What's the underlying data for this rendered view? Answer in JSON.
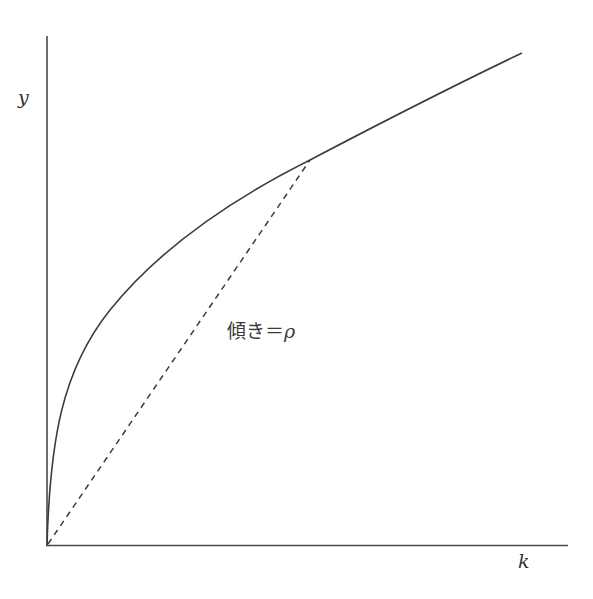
{
  "diagram": {
    "type": "production-function-curve",
    "axes": {
      "y_label": "y",
      "x_label": "k"
    },
    "annotation": {
      "slope_text": "傾き＝",
      "slope_symbol": "ρ"
    },
    "curves": [
      {
        "name": "production-curve",
        "style": "solid",
        "shape": "concave-increasing"
      },
      {
        "name": "ray-from-origin",
        "style": "dashed",
        "from": "origin",
        "to": "tangent-point"
      }
    ],
    "colors": {
      "line": "#3c3c3c",
      "background": "#ffffff"
    }
  }
}
